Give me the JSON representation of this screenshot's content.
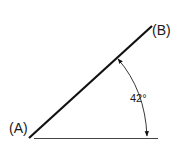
{
  "diagram": {
    "type": "angle-measurement",
    "point_a_label": "(A)",
    "point_b_label": "(B)",
    "angle_label": "42°",
    "angle_degrees": 42,
    "colors": {
      "line": "#111111",
      "baseline": "#444444",
      "text": "#1a1a1a"
    }
  }
}
